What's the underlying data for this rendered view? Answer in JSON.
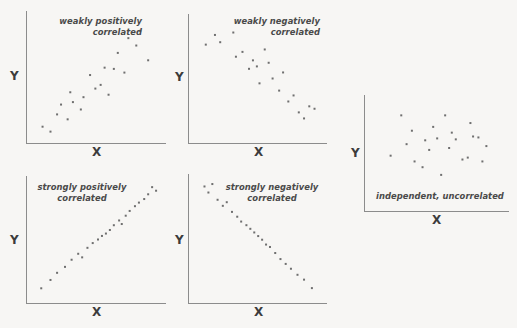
{
  "figure": {
    "background_color": "#f7f6f4",
    "dot_color": "#6f6f6f",
    "axis_color": "#8c8c8c",
    "text_color": "#4a4a4a"
  },
  "axis_labels": {
    "x": "X",
    "y": "Y"
  },
  "chart_data": [
    {
      "type": "scatter",
      "id": "weakly-positive",
      "title": "weakly positively\ncorrelated",
      "caption_line1": "weakly positively",
      "caption_line2": "correlated",
      "xlabel": "X",
      "ylabel": "Y",
      "xlim": [
        0,
        100
      ],
      "ylim": [
        0,
        100
      ],
      "grid": false,
      "legend": "none",
      "points": [
        [
          8,
          10
        ],
        [
          14,
          6
        ],
        [
          19,
          20
        ],
        [
          22,
          28
        ],
        [
          27,
          16
        ],
        [
          29,
          38
        ],
        [
          31,
          30
        ],
        [
          37,
          24
        ],
        [
          39,
          34
        ],
        [
          44,
          52
        ],
        [
          48,
          41
        ],
        [
          52,
          44
        ],
        [
          55,
          58
        ],
        [
          58,
          36
        ],
        [
          62,
          57
        ],
        [
          65,
          70
        ],
        [
          70,
          54
        ],
        [
          73,
          82
        ],
        [
          79,
          76
        ],
        [
          82,
          88
        ],
        [
          88,
          64
        ]
      ]
    },
    {
      "type": "scatter",
      "id": "weakly-negative",
      "title": "weakly negatively\ncorrelated",
      "caption_line1": "weakly negatively",
      "caption_line2": "correlated",
      "xlabel": "X",
      "ylabel": "Y",
      "xlim": [
        0,
        100
      ],
      "ylim": [
        0,
        100
      ],
      "grid": false,
      "legend": "none",
      "points": [
        [
          9,
          78
        ],
        [
          16,
          86
        ],
        [
          20,
          80
        ],
        [
          30,
          88
        ],
        [
          32,
          68
        ],
        [
          37,
          72
        ],
        [
          42,
          58
        ],
        [
          45,
          65
        ],
        [
          48,
          60
        ],
        [
          50,
          46
        ],
        [
          54,
          74
        ],
        [
          57,
          63
        ],
        [
          60,
          50
        ],
        [
          65,
          40
        ],
        [
          68,
          55
        ],
        [
          72,
          31
        ],
        [
          76,
          36
        ],
        [
          80,
          22
        ],
        [
          84,
          17
        ],
        [
          88,
          27
        ],
        [
          92,
          25
        ]
      ]
    },
    {
      "type": "scatter",
      "id": "strongly-positive",
      "title": "strongly positively\ncorrelated",
      "caption_line1": "strongly positively",
      "caption_line2": "correlated",
      "xlabel": "X",
      "ylabel": "Y",
      "xlim": [
        0,
        100
      ],
      "ylim": [
        0,
        100
      ],
      "grid": false,
      "legend": "none",
      "points": [
        [
          7,
          9
        ],
        [
          14,
          16
        ],
        [
          19,
          22
        ],
        [
          25,
          27
        ],
        [
          30,
          33
        ],
        [
          35,
          38
        ],
        [
          38,
          35
        ],
        [
          42,
          43
        ],
        [
          46,
          47
        ],
        [
          50,
          50
        ],
        [
          53,
          53
        ],
        [
          56,
          55
        ],
        [
          59,
          58
        ],
        [
          62,
          62
        ],
        [
          66,
          66
        ],
        [
          68,
          63
        ],
        [
          71,
          70
        ],
        [
          74,
          74
        ],
        [
          78,
          78
        ],
        [
          81,
          81
        ],
        [
          85,
          84
        ],
        [
          88,
          88
        ],
        [
          91,
          94
        ],
        [
          94,
          91
        ]
      ]
    },
    {
      "type": "scatter",
      "id": "strongly-negative",
      "title": "strongly negatively\ncorrelated",
      "caption_line1": "strongly negatively",
      "caption_line2": "correlated",
      "xlabel": "X",
      "ylabel": "Y",
      "xlim": [
        0,
        100
      ],
      "ylim": [
        0,
        100
      ],
      "grid": false,
      "legend": "none",
      "points": [
        [
          8,
          93
        ],
        [
          11,
          88
        ],
        [
          14,
          95
        ],
        [
          18,
          82
        ],
        [
          22,
          77
        ],
        [
          25,
          80
        ],
        [
          29,
          72
        ],
        [
          33,
          68
        ],
        [
          36,
          64
        ],
        [
          40,
          61
        ],
        [
          43,
          58
        ],
        [
          46,
          55
        ],
        [
          49,
          52
        ],
        [
          52,
          49
        ],
        [
          55,
          45
        ],
        [
          58,
          43
        ],
        [
          62,
          38
        ],
        [
          66,
          33
        ],
        [
          70,
          29
        ],
        [
          74,
          25
        ],
        [
          79,
          20
        ],
        [
          84,
          16
        ],
        [
          90,
          9
        ]
      ]
    },
    {
      "type": "scatter",
      "id": "independent-uncorrelated",
      "title": "independent, uncorrelated",
      "caption_line1": "independent, uncorrelated",
      "caption_line2": "",
      "xlabel": "X",
      "ylabel": "Y",
      "xlim": [
        0,
        100
      ],
      "ylim": [
        0,
        100
      ],
      "grid": false,
      "legend": "none",
      "points": [
        [
          14,
          42
        ],
        [
          22,
          84
        ],
        [
          26,
          54
        ],
        [
          30,
          68
        ],
        [
          32,
          36
        ],
        [
          38,
          30
        ],
        [
          40,
          58
        ],
        [
          43,
          48
        ],
        [
          46,
          72
        ],
        [
          49,
          60
        ],
        [
          52,
          22
        ],
        [
          55,
          84
        ],
        [
          58,
          50
        ],
        [
          60,
          66
        ],
        [
          63,
          59
        ],
        [
          68,
          38
        ],
        [
          72,
          40
        ],
        [
          74,
          76
        ],
        [
          76,
          62
        ],
        [
          80,
          61
        ],
        [
          83,
          36
        ],
        [
          86,
          52
        ]
      ]
    }
  ],
  "panels": [
    {
      "name": "panel-weakly-positive",
      "caption_align": "right",
      "caption_box": {
        "left": 38,
        "top": 16,
        "width": 104
      }
    },
    {
      "name": "panel-weakly-negative",
      "caption_align": "right",
      "caption_box": {
        "left": 213,
        "top": 16,
        "width": 107
      }
    },
    {
      "name": "panel-strongly-positive",
      "caption_align": "center",
      "caption_box": {
        "left": 26,
        "top": 182,
        "width": 112
      }
    },
    {
      "name": "panel-strongly-negative",
      "caption_align": "center",
      "caption_box": {
        "left": 220,
        "top": 182,
        "width": 104
      }
    },
    {
      "name": "panel-independent",
      "caption_align": "left",
      "caption_box": {
        "left": 376,
        "top": 193,
        "width": 130
      }
    }
  ]
}
